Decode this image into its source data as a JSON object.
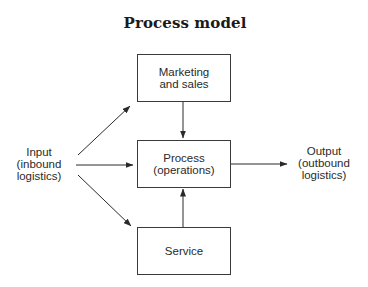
{
  "title": "Process model",
  "nodes": {
    "marketing": {
      "lines": [
        "Marketing",
        "and sales"
      ]
    },
    "process": {
      "lines": [
        "Process",
        "(operations)"
      ]
    },
    "service": {
      "lines": [
        "Service"
      ]
    },
    "input": {
      "lines": [
        "Input",
        "(inbound",
        "logistics)"
      ]
    },
    "output": {
      "lines": [
        "Output",
        "(outbound",
        "logistics)"
      ]
    }
  },
  "edges": [
    {
      "from": "input",
      "to": "marketing"
    },
    {
      "from": "input",
      "to": "process"
    },
    {
      "from": "input",
      "to": "service"
    },
    {
      "from": "marketing",
      "to": "process"
    },
    {
      "from": "service",
      "to": "process"
    },
    {
      "from": "process",
      "to": "output"
    }
  ],
  "colors": {
    "line": "#2a2a2a",
    "text": "#2a2a2a",
    "background": "#ffffff"
  }
}
